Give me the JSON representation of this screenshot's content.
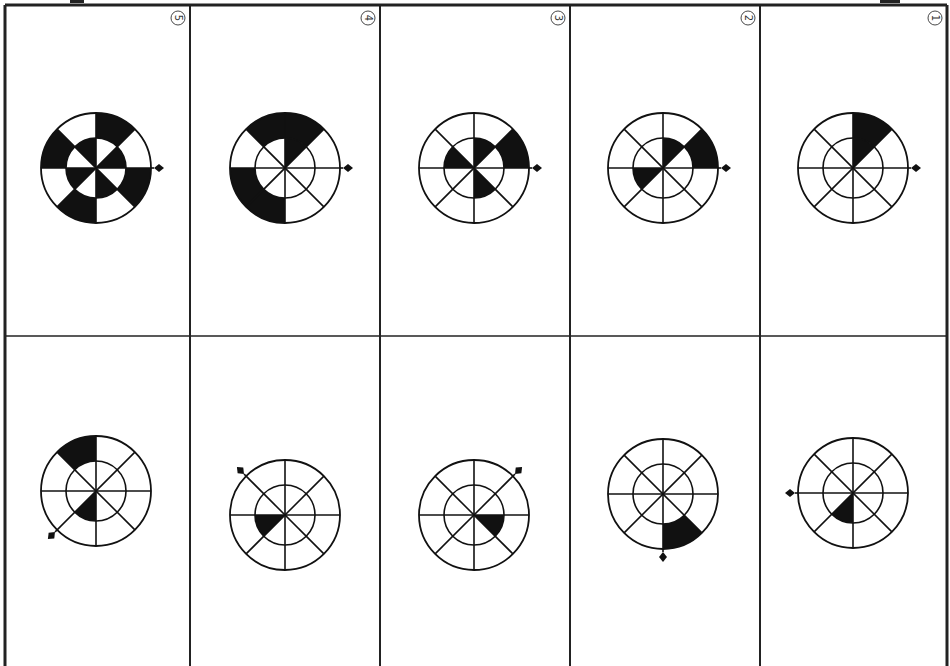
{
  "document": {
    "title": "Rotating wheel sequence puzzle",
    "description": "Top row: five numbered wheel figures; bottom row: five unnumbered wheel figures"
  },
  "colors": {
    "ink": "#111111",
    "paper": "#ffffff",
    "grid": "#222222"
  },
  "sector_convention": "sector k spans k*45 to (k+1)*45 degrees, counter-clockwise from east",
  "top_row": [
    {
      "label": "⑤",
      "number": 5,
      "outer_black": [
        1,
        3,
        5,
        7
      ],
      "inner_black": [
        0,
        2,
        4,
        6
      ],
      "pointer_angle": 0
    },
    {
      "label": "④",
      "number": 4,
      "outer_black": [
        1,
        2,
        4,
        5
      ],
      "inner_black": [
        1
      ],
      "pointer_angle": 0
    },
    {
      "label": "③",
      "number": 3,
      "outer_black": [
        0
      ],
      "inner_black": [
        1,
        3,
        6
      ],
      "pointer_angle": 0
    },
    {
      "label": "②",
      "number": 2,
      "outer_black": [
        0
      ],
      "inner_black": [
        1,
        4
      ],
      "pointer_angle": 0
    },
    {
      "label": "①",
      "number": 1,
      "outer_black": [
        1
      ],
      "inner_black": [
        1
      ],
      "pointer_angle": 0
    }
  ],
  "bottom_row": [
    {
      "outer_black": [
        2
      ],
      "inner_black": [
        5
      ],
      "pointer_angle": 225
    },
    {
      "outer_black": [],
      "inner_black": [
        4
      ],
      "pointer_angle": 135
    },
    {
      "outer_black": [],
      "inner_black": [
        7
      ],
      "pointer_angle": 45
    },
    {
      "outer_black": [
        6
      ],
      "inner_black": [],
      "pointer_angle": 270
    },
    {
      "outer_black": [],
      "inner_black": [
        5
      ],
      "pointer_angle": 180
    }
  ]
}
